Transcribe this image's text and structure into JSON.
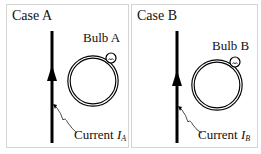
{
  "panels": [
    {
      "case_label": "Case A",
      "bulb_label": "Bulb A",
      "current_label": "Current",
      "current_symbol": "I",
      "current_subscript": "A"
    },
    {
      "case_label": "Case B",
      "bulb_label": "Bulb B",
      "current_label": "Current",
      "current_symbol": "I",
      "current_subscript": "B"
    }
  ],
  "colors": {
    "wire": "#000000",
    "border": "#d4d4d4"
  }
}
